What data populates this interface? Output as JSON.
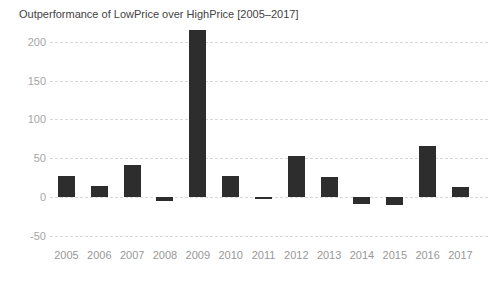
{
  "chart_data": {
    "type": "bar",
    "title": "Outperformance of LowPrice over HighPrice [2005–2017]",
    "categories": [
      "2005",
      "2006",
      "2007",
      "2008",
      "2009",
      "2010",
      "2011",
      "2012",
      "2013",
      "2014",
      "2015",
      "2016",
      "2017"
    ],
    "values": [
      27,
      14,
      41,
      -5,
      215,
      27,
      -1,
      53,
      26,
      -9,
      -10,
      66,
      13
    ],
    "xlabel": "",
    "ylabel": "",
    "ylim": [
      -50,
      220
    ],
    "yticks": [
      200,
      150,
      100,
      50,
      0,
      -50
    ],
    "grid": "horizontal-dashed",
    "legend": "none",
    "colors": {
      "bar": "#2d2d2d",
      "title_text": "#3f3f3f",
      "ytick_text": "#a6a6a6",
      "xtick_text": "#989898",
      "gridline": "#d8d8d8",
      "background": "#ffffff"
    }
  }
}
